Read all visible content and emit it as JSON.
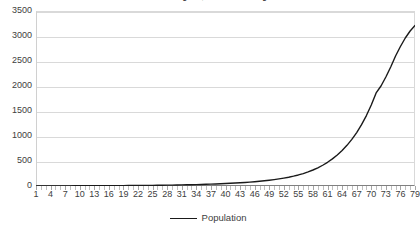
{
  "chart_data": {
    "type": "line",
    "title": "one child at age 30, and ½ child at age 40",
    "xlabel": "",
    "ylabel": "",
    "ylim": [
      0,
      3500
    ],
    "xlim": [
      1,
      79
    ],
    "grid": true,
    "legend_position": "bottom",
    "y_ticks": [
      0,
      500,
      1000,
      1500,
      2000,
      2500,
      3000,
      3500
    ],
    "y_tick_labels": [
      "0",
      "500",
      "1000",
      "1500",
      "2000",
      "2500",
      "3000",
      "3500"
    ],
    "x_tick_labels": [
      "1",
      "4",
      "7",
      "10",
      "13",
      "16",
      "19",
      "22",
      "25",
      "28",
      "31",
      "34",
      "37",
      "40",
      "43",
      "46",
      "49",
      "52",
      "55",
      "58",
      "61",
      "64",
      "67",
      "70",
      "73",
      "76",
      "79"
    ],
    "x": [
      1,
      2,
      3,
      4,
      5,
      6,
      7,
      8,
      9,
      10,
      11,
      12,
      13,
      14,
      15,
      16,
      17,
      18,
      19,
      20,
      21,
      22,
      23,
      24,
      25,
      26,
      27,
      28,
      29,
      30,
      31,
      32,
      33,
      34,
      35,
      36,
      37,
      38,
      39,
      40,
      41,
      42,
      43,
      44,
      45,
      46,
      47,
      48,
      49,
      50,
      51,
      52,
      53,
      54,
      55,
      56,
      57,
      58,
      59,
      60,
      61,
      62,
      63,
      64,
      65,
      66,
      67,
      68,
      69,
      70,
      71,
      72,
      73,
      74,
      75,
      76,
      77,
      78,
      79
    ],
    "series": [
      {
        "name": "Population",
        "color": "#1a1a1a",
        "values": [
          2,
          2,
          2,
          2,
          3,
          3,
          3,
          3,
          4,
          4,
          4,
          5,
          5,
          5,
          6,
          6,
          7,
          7,
          8,
          9,
          9,
          10,
          11,
          12,
          13,
          14,
          15,
          17,
          18,
          20,
          22,
          24,
          26,
          28,
          31,
          34,
          37,
          41,
          45,
          49,
          54,
          59,
          65,
          71,
          78,
          86,
          95,
          105,
          116,
          128,
          142,
          158,
          176,
          197,
          221,
          249,
          282,
          320,
          364,
          415,
          474,
          542,
          620,
          710,
          813,
          932,
          1069,
          1227,
          1409,
          1619,
          1861,
          2000,
          2180,
          2380,
          2600,
          2790,
          2960,
          3100,
          3210
        ]
      }
    ]
  },
  "legend": {
    "entries": [
      {
        "label": "Population",
        "marker": "line-marker",
        "color": "#1a1a1a"
      }
    ]
  }
}
